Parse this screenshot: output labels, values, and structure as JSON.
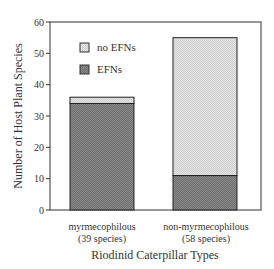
{
  "chart_data": {
    "type": "bar",
    "stacked": true,
    "title": "",
    "xlabel": "Riodinid Caterpillar Types",
    "ylabel": "Number of Host Plant Species",
    "ylim": [
      0,
      60
    ],
    "yticks": [
      0,
      10,
      20,
      30,
      40,
      50,
      60
    ],
    "categories": [
      "myrmecophilous",
      "non-myrmecophilous"
    ],
    "category_sublabels": [
      "(39 species)",
      "(58 species)"
    ],
    "series": [
      {
        "name": "EFNs",
        "values": [
          34,
          11
        ],
        "color": "#7a7a7a"
      },
      {
        "name": "no EFNs",
        "values": [
          2,
          44
        ],
        "color": "#dcdcdc"
      }
    ],
    "totals": [
      36,
      55
    ],
    "legend_position": "upper-left",
    "grid": false
  },
  "legend": {
    "items": [
      {
        "label": "no EFNs"
      },
      {
        "label": "EFNs"
      }
    ]
  },
  "axis": {
    "y_ticks": [
      "0",
      "10",
      "20",
      "30",
      "40",
      "50",
      "60"
    ],
    "x_title": "Riodinid Caterpillar Types",
    "y_title": "Number of Host Plant Species",
    "categories": [
      {
        "name": "myrmecophilous",
        "sub": "(39 species)"
      },
      {
        "name": "non-myrmecophilous",
        "sub": "(58 species)"
      }
    ]
  }
}
